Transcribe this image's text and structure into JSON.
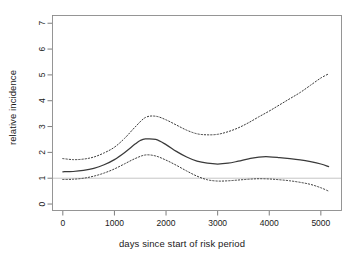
{
  "chart_data": {
    "type": "line",
    "title": "",
    "xlabel": "days since start of risk period",
    "ylabel": "relative incidence",
    "xlim": [
      -200,
      5400
    ],
    "ylim": [
      -0.25,
      7.3
    ],
    "xticks": [
      0,
      1000,
      2000,
      3000,
      4000,
      5000
    ],
    "xtick_labels": [
      "0",
      "1000",
      "2000",
      "3000",
      "4000",
      "5000"
    ],
    "yticks": [
      0,
      1,
      2,
      3,
      4,
      5,
      6,
      7
    ],
    "ytick_labels": [
      "0",
      "1",
      "2",
      "3",
      "4",
      "5",
      "6",
      "7"
    ],
    "grid": false,
    "legend": "none",
    "reference_line": {
      "orientation": "horizontal",
      "y": 1,
      "color": "#bdbdbd",
      "style": "solid"
    },
    "series": [
      {
        "name": "relative incidence estimate",
        "style": "solid",
        "color": "#3a3a3a",
        "x": [
          0,
          200,
          400,
          600,
          800,
          1000,
          1200,
          1400,
          1500,
          1600,
          1800,
          2000,
          2200,
          2400,
          2600,
          2800,
          3000,
          3200,
          3400,
          3600,
          3800,
          4000,
          4200,
          4400,
          4600,
          4800,
          5000,
          5150
        ],
        "values": [
          1.25,
          1.26,
          1.3,
          1.38,
          1.52,
          1.72,
          2.0,
          2.32,
          2.46,
          2.52,
          2.5,
          2.3,
          2.04,
          1.82,
          1.66,
          1.58,
          1.55,
          1.58,
          1.66,
          1.75,
          1.82,
          1.83,
          1.8,
          1.76,
          1.71,
          1.64,
          1.55,
          1.45
        ]
      },
      {
        "name": "upper 95% confidence limit",
        "style": "dashed",
        "color": "#3a3a3a",
        "x": [
          0,
          200,
          400,
          600,
          800,
          1000,
          1200,
          1400,
          1600,
          1800,
          2000,
          2200,
          2400,
          2600,
          2800,
          3000,
          3200,
          3400,
          3600,
          3800,
          4000,
          4200,
          4400,
          4600,
          4800,
          5000,
          5150
        ],
        "values": [
          1.76,
          1.72,
          1.74,
          1.82,
          1.98,
          2.2,
          2.55,
          2.98,
          3.35,
          3.4,
          3.26,
          3.06,
          2.86,
          2.72,
          2.68,
          2.7,
          2.8,
          2.95,
          3.15,
          3.38,
          3.6,
          3.84,
          4.08,
          4.32,
          4.6,
          4.88,
          5.04
        ]
      },
      {
        "name": "lower 95% confidence limit",
        "style": "dashed",
        "color": "#3a3a3a",
        "x": [
          0,
          200,
          400,
          600,
          800,
          1000,
          1200,
          1400,
          1600,
          1800,
          2000,
          2200,
          2400,
          2600,
          2800,
          3000,
          3200,
          3400,
          3600,
          3800,
          4000,
          4200,
          4400,
          4600,
          4800,
          5000,
          5150
        ],
        "values": [
          0.95,
          0.96,
          1.0,
          1.08,
          1.2,
          1.36,
          1.56,
          1.76,
          1.9,
          1.86,
          1.7,
          1.5,
          1.28,
          1.08,
          0.94,
          0.89,
          0.9,
          0.93,
          0.96,
          0.98,
          0.97,
          0.94,
          0.9,
          0.84,
          0.76,
          0.63,
          0.5
        ]
      }
    ]
  }
}
